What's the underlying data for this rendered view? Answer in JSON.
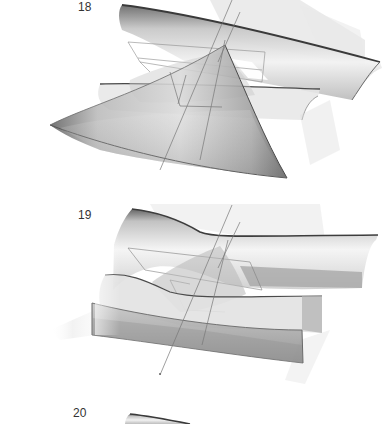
{
  "figures": [
    {
      "id": "18",
      "label": "18",
      "label_x": 78,
      "label_y": 0,
      "top": 0
    },
    {
      "id": "19",
      "label": "19",
      "label_x": 78,
      "label_y": 208,
      "top": 0
    },
    {
      "id": "20",
      "label": "20",
      "label_x": 73,
      "label_y": 406,
      "top": 0
    }
  ],
  "colors": {
    "surface_dark": "#5a5a5a",
    "surface_mid": "#9a9a9a",
    "surface_light": "#e4e4e4",
    "plane": "#d0d0d0",
    "axis": "#7a7a7a",
    "background": "#ffffff"
  }
}
